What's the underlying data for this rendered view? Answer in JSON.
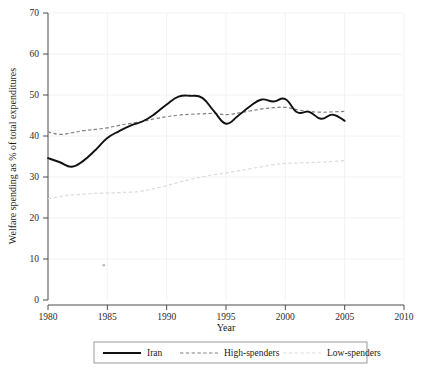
{
  "chart_data": {
    "type": "line",
    "title": "",
    "xlabel": "Year",
    "ylabel": "Welfare spending as % of total expenditures",
    "xlim": [
      1980,
      2010
    ],
    "ylim": [
      0,
      70
    ],
    "xticks": [
      1980,
      1985,
      1990,
      1995,
      2000,
      2005,
      2010
    ],
    "yticks": [
      0,
      10,
      20,
      30,
      40,
      50,
      60,
      70
    ],
    "grid": true,
    "legend_position": "bottom",
    "x": [
      1980,
      1981,
      1982,
      1983,
      1984,
      1985,
      1986,
      1987,
      1988,
      1989,
      1990,
      1991,
      1992,
      1993,
      1994,
      1995,
      1996,
      1997,
      1998,
      1999,
      2000,
      2001,
      2002,
      2003,
      2004,
      2005
    ],
    "series": [
      {
        "name": "Iran",
        "style": "solid",
        "color": "#111111",
        "values": [
          34.6,
          33.6,
          32.5,
          34.0,
          36.6,
          39.5,
          41.2,
          42.6,
          43.6,
          45.4,
          47.7,
          49.6,
          49.8,
          49.3,
          46.0,
          43.0,
          44.9,
          47.2,
          48.9,
          48.4,
          49.0,
          45.8,
          45.9,
          44.2,
          45.2,
          43.7
        ]
      },
      {
        "name": "High-spenders",
        "style": "dashed",
        "color": "#808080",
        "values": [
          41.0,
          40.4,
          40.8,
          41.3,
          41.6,
          42.0,
          42.6,
          43.1,
          43.6,
          44.2,
          44.7,
          45.1,
          45.3,
          45.4,
          45.5,
          45.2,
          45.6,
          46.1,
          46.6,
          46.9,
          47.0,
          46.4,
          46.0,
          45.8,
          45.9,
          46.0
        ]
      },
      {
        "name": "Low-spenders",
        "style": "dashed",
        "color": "#dcdcdc",
        "values": [
          24.7,
          25.2,
          25.6,
          25.8,
          26.0,
          26.1,
          26.2,
          26.3,
          26.6,
          27.2,
          27.9,
          28.7,
          29.4,
          30.0,
          30.6,
          31.0,
          31.5,
          32.0,
          32.5,
          33.0,
          33.3,
          33.4,
          33.5,
          33.6,
          33.8,
          34.0
        ]
      }
    ],
    "annotations": [
      {
        "name": "stray-marker",
        "x": 1984.7,
        "y": 8.5
      }
    ]
  },
  "axes": {
    "y_label": "Welfare spending as % of total expenditures",
    "x_label": "Year",
    "y_tick_labels": [
      "0",
      "10",
      "20",
      "30",
      "40",
      "50",
      "60",
      "70"
    ],
    "x_tick_labels": [
      "1980",
      "1985",
      "1990",
      "1995",
      "2000",
      "2005",
      "2010"
    ]
  },
  "legend": {
    "entries": [
      {
        "label": "Iran",
        "style": "solid",
        "color": "#111111"
      },
      {
        "label": "High-spenders",
        "style": "dashed",
        "color": "#808080"
      },
      {
        "label": "Low-spenders",
        "style": "dashed",
        "color": "#dcdcdc"
      }
    ]
  }
}
